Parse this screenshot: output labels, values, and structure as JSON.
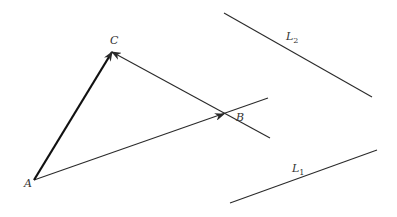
{
  "diagram": {
    "stroke_color": "#2a2a2a",
    "points": {
      "A": {
        "label": "A",
        "x": 34,
        "y": 180,
        "label_x": 24,
        "label_y": 187
      },
      "B": {
        "label": "B",
        "x": 224,
        "y": 114,
        "label_x": 236,
        "label_y": 121
      },
      "C": {
        "label": "C",
        "x": 112,
        "y": 52,
        "label_x": 110,
        "label_y": 44
      }
    },
    "lines": {
      "L1": {
        "label": "L",
        "sub": "1",
        "x1": 230,
        "y1": 203,
        "x2": 377,
        "y2": 150,
        "label_x": 292,
        "label_y": 172
      },
      "L2": {
        "label": "L",
        "sub": "2",
        "x1": 224,
        "y1": 13,
        "x2": 372,
        "y2": 97,
        "label_x": 286,
        "label_y": 40
      }
    },
    "through_B": {
      "x1": 34,
      "y1": 180,
      "x2": 268,
      "y2": 98
    },
    "through_C": {
      "x1": 270,
      "y1": 138,
      "x2": 112,
      "y2": 52
    },
    "vector_AC": {
      "x1": 34,
      "y1": 180,
      "x2": 112,
      "y2": 52
    }
  }
}
